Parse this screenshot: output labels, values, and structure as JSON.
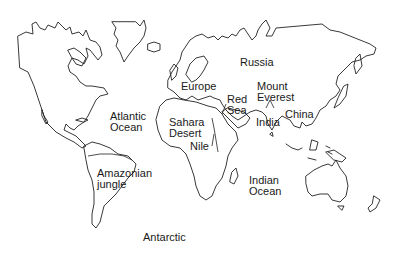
{
  "map": {
    "title": "World map",
    "style": "black-and-white outline",
    "colors": {
      "outline": "#222222",
      "background": "#ffffff",
      "text": "#1a1a1a"
    },
    "labels": [
      {
        "id": "russia",
        "text": "Russia",
        "type": "country"
      },
      {
        "id": "europe",
        "text": "Europe",
        "type": "continent"
      },
      {
        "id": "mount-everest",
        "text": "Mount\nEverest",
        "type": "mountain"
      },
      {
        "id": "red-sea",
        "text": "Red\nSea",
        "type": "sea"
      },
      {
        "id": "atlantic-ocean",
        "text": "Atlantic\nOcean",
        "type": "ocean"
      },
      {
        "id": "sahara-desert",
        "text": "Sahara\nDesert",
        "type": "desert"
      },
      {
        "id": "india",
        "text": "India",
        "type": "country"
      },
      {
        "id": "china",
        "text": "China",
        "type": "country"
      },
      {
        "id": "nile",
        "text": "Nile",
        "type": "river"
      },
      {
        "id": "amazonian-jungle",
        "text": "Amazonian\njungle",
        "type": "forest"
      },
      {
        "id": "indian-ocean",
        "text": "Indian\nOcean",
        "type": "ocean"
      },
      {
        "id": "antarctic",
        "text": "Antarctic",
        "type": "region"
      }
    ]
  }
}
